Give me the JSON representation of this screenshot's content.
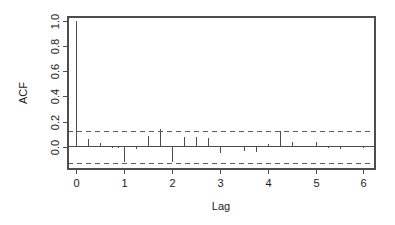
{
  "chart_data": {
    "type": "bar",
    "title": "",
    "subtitle": "",
    "xlabel": "Lag",
    "ylabel": "ACF",
    "xlim": [
      -0.16,
      6.24
    ],
    "ylim": [
      -0.175,
      1.03
    ],
    "grid": false,
    "legend": "none",
    "x_ticks": [
      0,
      1,
      2,
      3,
      4,
      5,
      6
    ],
    "x_tick_labels": [
      "0",
      "1",
      "2",
      "3",
      "4",
      "5",
      "6"
    ],
    "y_ticks": [
      0.0,
      0.2,
      0.4,
      0.6,
      0.8,
      1.0
    ],
    "y_tick_labels": [
      "0.0",
      "0.2",
      "0.4",
      "0.6",
      "0.8",
      "1.0"
    ],
    "zero_line": 0.0,
    "confidence_bounds": [
      0.125,
      -0.125
    ],
    "confidence_line_style": "dashed",
    "lag_step": 0.125,
    "x": [
      0,
      0.125,
      0.25,
      0.375,
      0.5,
      0.625,
      0.75,
      0.875,
      1,
      1.125,
      1.25,
      1.375,
      1.5,
      1.625,
      1.75,
      1.875,
      2,
      2.125,
      2.25,
      2.375,
      2.5,
      2.625,
      2.75,
      2.875,
      3,
      3.125,
      3.25,
      3.375,
      3.5,
      3.625,
      3.75,
      3.875,
      4,
      4.125,
      4.25,
      4.375,
      4.5,
      4.625,
      4.75,
      4.875,
      5,
      5.125,
      5.25,
      5.375,
      5.5,
      5.625,
      5.75,
      5.875,
      6,
      6.125
    ],
    "values": [
      1.0,
      0.0,
      0.06,
      0.0,
      0.03,
      0.0,
      -0.01,
      -0.01,
      -0.12,
      0.0,
      -0.02,
      0.0,
      0.09,
      0.0,
      0.14,
      0.0,
      -0.12,
      0.0,
      0.08,
      0.0,
      0.08,
      0.0,
      0.07,
      0.0,
      -0.05,
      0.0,
      0.01,
      0.0,
      -0.03,
      0.0,
      -0.04,
      0.0,
      0.02,
      0.0,
      0.13,
      0.0,
      0.04,
      0.0,
      0.0,
      0.0,
      0.04,
      0.0,
      -0.01,
      0.0,
      -0.02,
      0.0,
      0.0,
      0.0,
      -0.01,
      0.0
    ]
  },
  "axis": {
    "ylabel": "ACF",
    "xlabel": "Lag"
  }
}
